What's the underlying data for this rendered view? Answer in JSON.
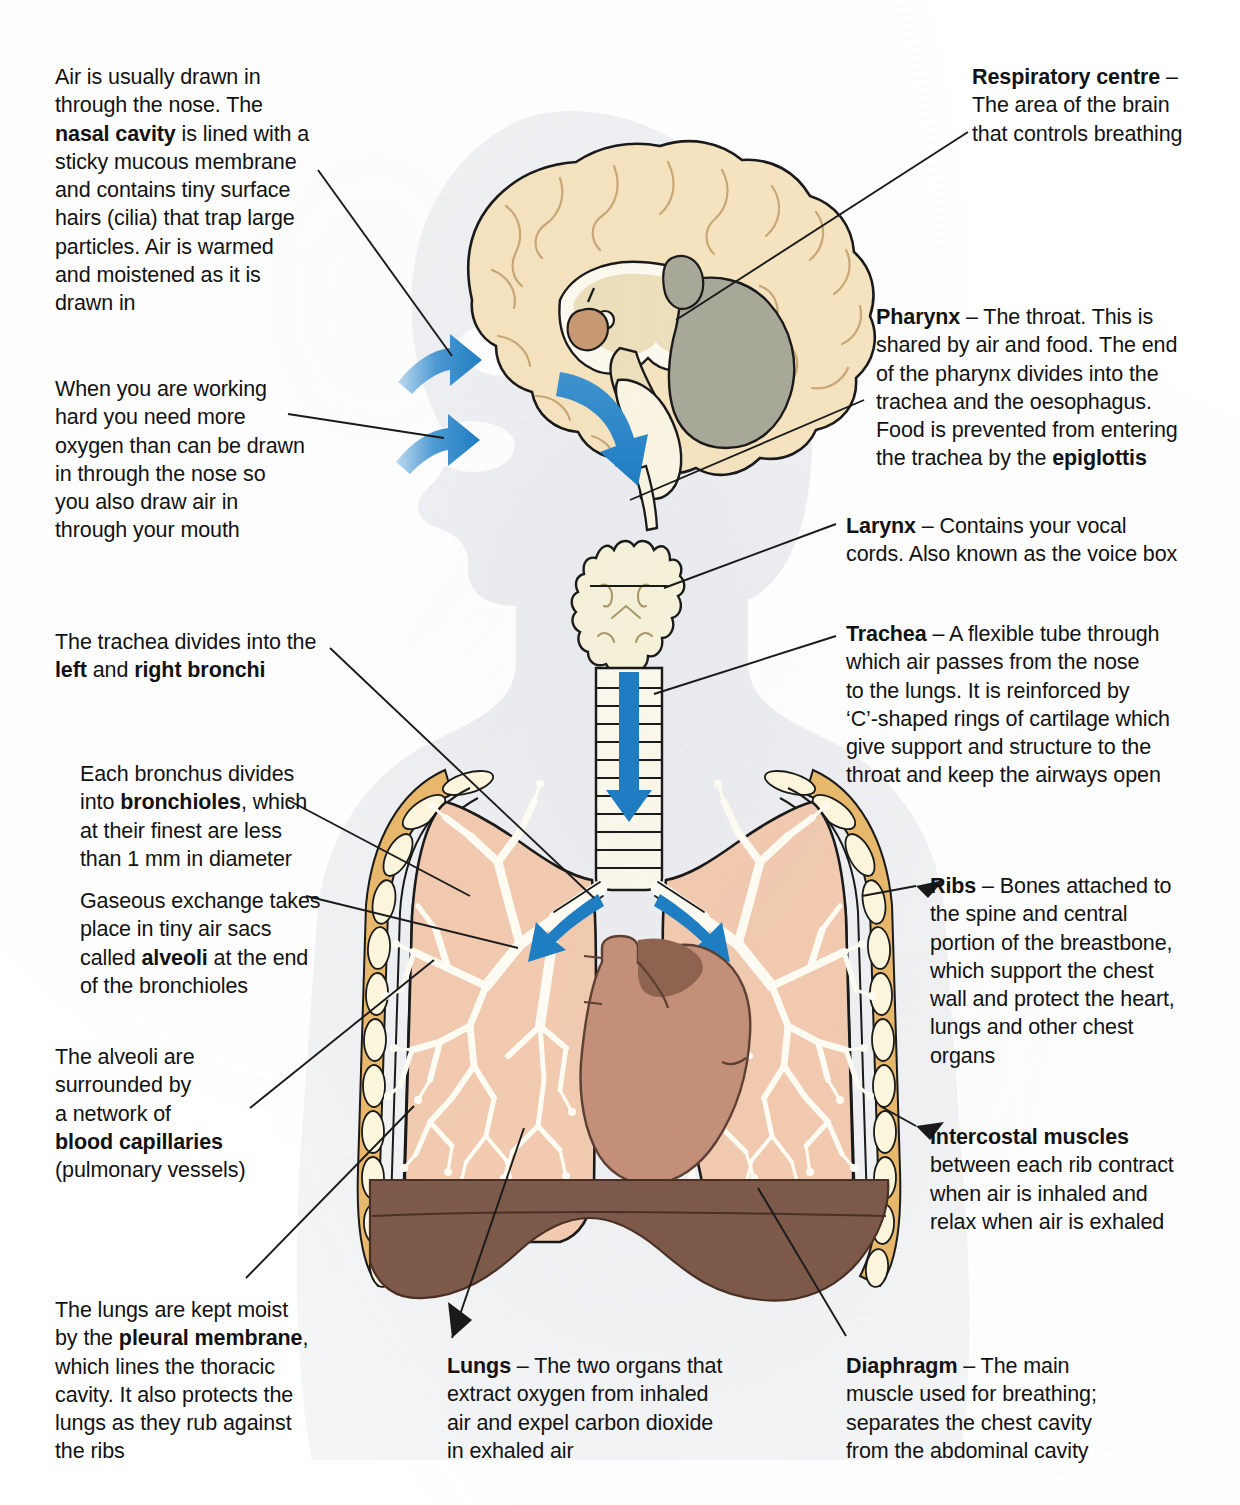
{
  "document": {
    "title": "The respiratory system",
    "type": "anatomical-diagram"
  },
  "palette": {
    "brain_cortex": "#f6e4c0",
    "brain_inner": "#fdfaf0",
    "cerebellum": "#a9a999",
    "pituitary": "#c89a74",
    "larynx": "#f7f2da",
    "trachea": "#fbf8ec",
    "lung": "#f2cbb0",
    "bronchi": "#fffdf4",
    "heart": "#c4907a",
    "heart_shadow": "#8f6450",
    "diaphragm": "#7d5a4a",
    "rib": "#fdf8dd",
    "intercostal": "#e9b96c",
    "arrow_blue": "#1f7ec4",
    "silhouette": "#eceef0",
    "outline": "#1a1a1a",
    "text": "#121212"
  },
  "callouts": {
    "nasal_cavity": {
      "id": "nasal-cavity-note",
      "segments": [
        {
          "text": "Air is usually drawn in\nthrough the nose. The\n",
          "bold": false
        },
        {
          "text": "nasal cavity",
          "bold": true
        },
        {
          "text": " is lined with a\nsticky mucous membrane\nand contains tiny surface\nhairs (cilia) that trap large\nparticles. Air is warmed\nand moistened as it is\ndrawn in",
          "bold": false
        }
      ]
    },
    "mouth_breathing": {
      "id": "mouth-breathing-note",
      "segments": [
        {
          "text": "When you are working\nhard you need more\noxygen than can be drawn\nin through the nose so\nyou also draw air in\nthrough your mouth",
          "bold": false
        }
      ]
    },
    "bronchi": {
      "id": "bronchi-note",
      "segments": [
        {
          "text": "The trachea divides into the\n",
          "bold": false
        },
        {
          "text": "left",
          "bold": true
        },
        {
          "text": " and ",
          "bold": false
        },
        {
          "text": "right bronchi",
          "bold": true
        }
      ]
    },
    "bronchioles": {
      "id": "bronchioles-note",
      "segments": [
        {
          "text": "Each bronchus divides\ninto ",
          "bold": false
        },
        {
          "text": "bronchioles",
          "bold": true
        },
        {
          "text": ", which\nat their finest are less\nthan 1 mm in diameter",
          "bold": false
        }
      ]
    },
    "alveoli": {
      "id": "alveoli-note",
      "segments": [
        {
          "text": "Gaseous exchange takes\nplace in tiny air sacs\ncalled ",
          "bold": false
        },
        {
          "text": "alveoli",
          "bold": true
        },
        {
          "text": " at the end\nof the bronchioles",
          "bold": false
        }
      ]
    },
    "capillaries": {
      "id": "blood-capillaries-note",
      "segments": [
        {
          "text": "The alveoli are\nsurrounded by\na network of\n",
          "bold": false
        },
        {
          "text": "blood capillaries",
          "bold": true
        },
        {
          "text": "\n(pulmonary vessels)",
          "bold": false
        }
      ]
    },
    "pleural_membrane": {
      "id": "pleural-membrane-note",
      "segments": [
        {
          "text": "The lungs are kept moist\nby the ",
          "bold": false
        },
        {
          "text": "pleural membrane",
          "bold": true
        },
        {
          "text": ",\nwhich lines the thoracic\ncavity. It also protects the\nlungs as they rub against\nthe ribs",
          "bold": false
        }
      ]
    },
    "respiratory_centre": {
      "id": "respiratory-centre-note",
      "segments": [
        {
          "text": "Respiratory centre",
          "bold": true
        },
        {
          "text": " –\nThe area of the brain\nthat controls breathing",
          "bold": false
        }
      ]
    },
    "pharynx": {
      "id": "pharynx-note",
      "segments": [
        {
          "text": "Pharynx",
          "bold": true
        },
        {
          "text": " – The throat. This is\nshared by air and food. The end\nof the pharynx divides into the\ntrachea and the oesophagus.\nFood is prevented from entering\nthe trachea by the ",
          "bold": false
        },
        {
          "text": "epiglottis",
          "bold": true
        }
      ]
    },
    "larynx": {
      "id": "larynx-note",
      "segments": [
        {
          "text": "Larynx",
          "bold": true
        },
        {
          "text": " – Contains your vocal\ncords. Also known as the voice box",
          "bold": false
        }
      ]
    },
    "trachea": {
      "id": "trachea-note",
      "segments": [
        {
          "text": "Trachea",
          "bold": true
        },
        {
          "text": " – A flexible tube through\nwhich air passes from the nose\nto the lungs. It is reinforced by\n‘C’-shaped rings of cartilage which\ngive support and structure to the\nthroat and keep the airways open",
          "bold": false
        }
      ]
    },
    "ribs": {
      "id": "ribs-note",
      "segments": [
        {
          "text": "Ribs",
          "bold": true
        },
        {
          "text": " – Bones attached to\nthe spine and central\nportion of the breastbone,\nwhich support the chest\nwall and protect the heart,\nlungs and other chest\norgans",
          "bold": false
        }
      ]
    },
    "intercostal": {
      "id": "intercostal-muscles-note",
      "segments": [
        {
          "text": "Intercostal muscles",
          "bold": true
        },
        {
          "text": "\nbetween each rib contract\nwhen air is inhaled and\nrelax when air is exhaled",
          "bold": false
        }
      ]
    },
    "lungs": {
      "id": "lungs-note",
      "segments": [
        {
          "text": "Lungs",
          "bold": true
        },
        {
          "text": " – The two organs that\nextract oxygen from inhaled\nair and expel carbon dioxide\nin exhaled air",
          "bold": false
        }
      ]
    },
    "diaphragm": {
      "id": "diaphragm-note",
      "segments": [
        {
          "text": "Diaphragm",
          "bold": true
        },
        {
          "text": " – The main\nmuscle used for breathing;\nseparates the chest cavity\nfrom the abdominal cavity",
          "bold": false
        }
      ]
    }
  },
  "anatomy_labels": {
    "brain": "brain-sagittal-section",
    "cerebellum": "cerebellum",
    "head_silhouette": "head-and-torso-silhouette",
    "larynx": "larynx",
    "trachea": "trachea",
    "left_lung": "left-lung",
    "right_lung": "right-lung",
    "bronchial_tree": "bronchial-tree",
    "heart": "heart",
    "diaphragm": "diaphragm",
    "ribcage": "ribcage",
    "airflow_arrows": "airflow-arrows"
  }
}
